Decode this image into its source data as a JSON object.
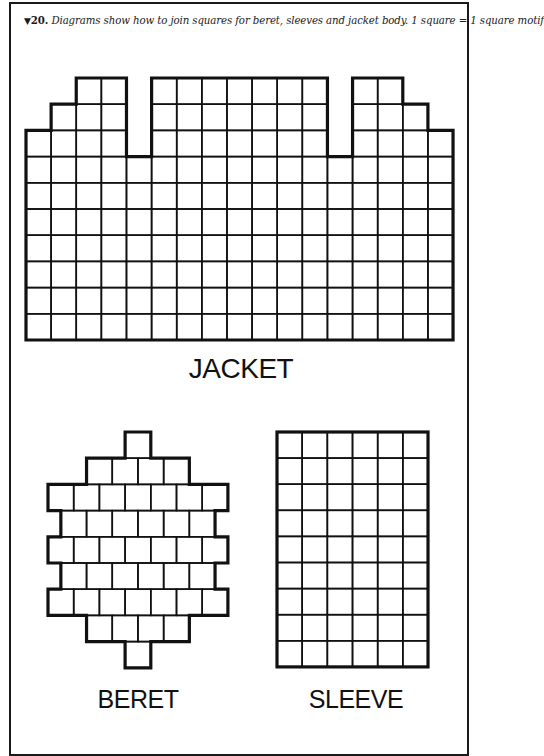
{
  "caption": {
    "marker": "▼",
    "number": "20.",
    "text": "Diagrams show how to join squares for beret, sleeves and jacket body. 1 square = 1 square motif"
  },
  "colors": {
    "line": "#111111",
    "background": "#ffffff"
  },
  "diagrams": {
    "jacket": {
      "label": "JACKET",
      "origin": [
        26,
        78
      ],
      "cell": [
        25.12,
        26.2
      ],
      "rows": 10,
      "column_start_rows": [
        2,
        1,
        0,
        0,
        3,
        0,
        0,
        0,
        0,
        0,
        0,
        0,
        3,
        0,
        0,
        1,
        2
      ]
    },
    "beret": {
      "label": "BERET",
      "origin": [
        48,
        432
      ],
      "cell": [
        25.7,
        26.2
      ],
      "row_counts": [
        1,
        4,
        7,
        6,
        7,
        6,
        7,
        4,
        1
      ],
      "row_offsets": [
        3,
        1.5,
        0,
        0.5,
        0,
        0.5,
        0,
        1.5,
        3
      ]
    },
    "sleeve": {
      "label": "SLEEVE",
      "origin": [
        277,
        432
      ],
      "cell": [
        25.17,
        26.1
      ],
      "columns": 6,
      "rows": 9
    }
  }
}
